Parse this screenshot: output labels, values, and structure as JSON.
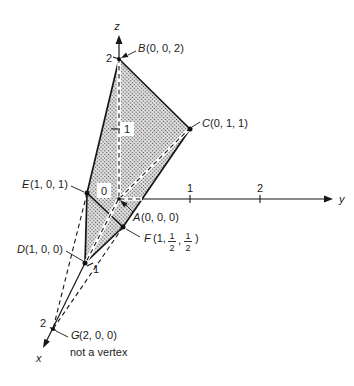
{
  "axes": {
    "x_label": "x",
    "y_label": "y",
    "z_label": "z",
    "x_tick_1": "1",
    "x_tick_2": "2",
    "y_tick_1": "1",
    "y_tick_2": "2",
    "z_tick_1": "1",
    "z_tick_2": "2",
    "origin_label": "0"
  },
  "points": {
    "A": {
      "name": "A",
      "coords_text": "(0, 0, 0)"
    },
    "B": {
      "name": "B",
      "coords_text": "(0, 0, 2)"
    },
    "C": {
      "name": "C",
      "coords_text": "(0, 1, 1)"
    },
    "D": {
      "name": "D",
      "coords_text": "(1, 0, 0)"
    },
    "E": {
      "name": "E",
      "coords_text": "(1, 0, 1)"
    },
    "F": {
      "name": "F",
      "open": "(1,",
      "frac1_num": "1",
      "frac1_den": "2",
      "comma": ",",
      "frac2_num": "1",
      "frac2_den": "2",
      "close": ")"
    },
    "G": {
      "name": "G",
      "coords_text": "(2, 0, 0)",
      "note": "not a vertex"
    }
  },
  "colors": {
    "ink": "#171717",
    "shade_bg": "#e3e3e3",
    "shade_dot": "#4a4a4a",
    "background": "#ffffff"
  }
}
